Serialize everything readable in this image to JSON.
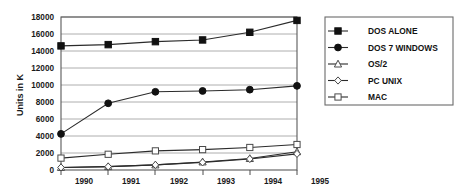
{
  "chart_data": {
    "type": "line",
    "title": "",
    "xlabel": "",
    "ylabel": "Units in K",
    "categories": [
      "1990",
      "1991",
      "1992",
      "1993",
      "1994",
      "1995"
    ],
    "x": [
      1990,
      1991,
      1992,
      1993,
      1994,
      1995
    ],
    "ylim": [
      0,
      18000
    ],
    "xlim": [
      1990,
      1995
    ],
    "yticks": [
      "0",
      "2000",
      "4000",
      "6000",
      "8000",
      "10000",
      "12000",
      "14000",
      "16000",
      "18000"
    ],
    "ytick_values": [
      0,
      2000,
      4000,
      6000,
      8000,
      10000,
      12000,
      14000,
      16000,
      18000
    ],
    "grid": "horizontal",
    "legend_position": "right",
    "series": [
      {
        "name": "DOS ALONE",
        "marker": "filled-square",
        "values": [
          14600,
          14750,
          15100,
          15300,
          16200,
          17600
        ]
      },
      {
        "name": "DOS 7 WINDOWS",
        "marker": "filled-circle",
        "values": [
          4250,
          7850,
          9200,
          9300,
          9450,
          9900
        ]
      },
      {
        "name": "OS/2",
        "marker": "open-triangle",
        "values": [
          300,
          400,
          600,
          950,
          1350,
          2150
        ]
      },
      {
        "name": "PC UNIX",
        "marker": "open-diamond",
        "values": [
          300,
          400,
          600,
          900,
          1300,
          1900
        ]
      },
      {
        "name": "MAC",
        "marker": "open-square",
        "values": [
          1400,
          1850,
          2250,
          2400,
          2650,
          3000
        ]
      }
    ]
  },
  "colors": {
    "series_line": "#2b2b2b",
    "marker_fill_dark": "#111111",
    "marker_fill_open": "#ffffff",
    "gridline": "#9a9a9a",
    "axis": "#4d4d4d",
    "text": "#111111",
    "background": "#ffffff"
  },
  "legend": {
    "entries": [
      {
        "label": "DOS ALONE"
      },
      {
        "label": "DOS 7 WINDOWS"
      },
      {
        "label": "OS/2"
      },
      {
        "label": "PC UNIX"
      },
      {
        "label": "MAC"
      }
    ]
  }
}
